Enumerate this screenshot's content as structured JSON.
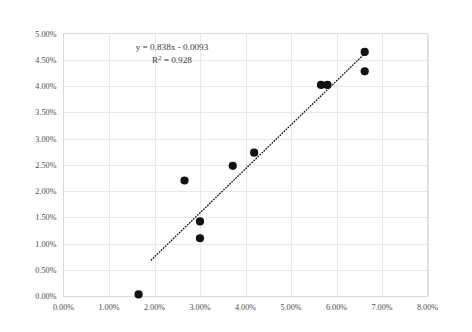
{
  "chart_data": {
    "type": "scatter",
    "title": "",
    "subtitle": "",
    "xlabel": "",
    "ylabel": "",
    "xlim": [
      0,
      8
    ],
    "ylim": [
      0,
      5
    ],
    "grid": true,
    "legend": false,
    "legend_position": "none",
    "x_tick_labels": [
      "0.00%",
      "1.00%",
      "2.00%",
      "3.00%",
      "4.00%",
      "5.00%",
      "6.00%",
      "7.00%",
      "8.00%"
    ],
    "x_tick_values": [
      0,
      1,
      2,
      3,
      4,
      5,
      6,
      7,
      8
    ],
    "y_tick_labels": [
      "0.00%",
      "0.50%",
      "1.00%",
      "1.50%",
      "2.00%",
      "2.50%",
      "3.00%",
      "3.50%",
      "4.00%",
      "4.50%",
      "5.00%"
    ],
    "y_tick_values": [
      0,
      0.5,
      1,
      1.5,
      2,
      2.5,
      3,
      3.5,
      4,
      4.5,
      5
    ],
    "units": "percent",
    "marker": "filled-circle",
    "marker_color": "#111111",
    "points": [
      {
        "x": 1.65,
        "y": 0.03
      },
      {
        "x": 2.66,
        "y": 2.2
      },
      {
        "x": 3.0,
        "y": 1.42
      },
      {
        "x": 3.0,
        "y": 1.1
      },
      {
        "x": 3.72,
        "y": 2.48
      },
      {
        "x": 4.19,
        "y": 2.73
      },
      {
        "x": 5.66,
        "y": 4.02
      },
      {
        "x": 5.8,
        "y": 4.02
      },
      {
        "x": 6.62,
        "y": 4.65
      },
      {
        "x": 6.62,
        "y": 4.28
      }
    ],
    "annotations": {
      "equation": "y = 0.838x - 0.0093",
      "r_squared_prefix": "R",
      "r_squared_sup": "2",
      "r_squared_value": " = 0.928"
    },
    "trendline": {
      "type": "linear-dotted",
      "slope": 0.838,
      "intercept": -0.0093,
      "color": "#111111",
      "x_start": 1.93,
      "x_end": 6.68
    }
  }
}
